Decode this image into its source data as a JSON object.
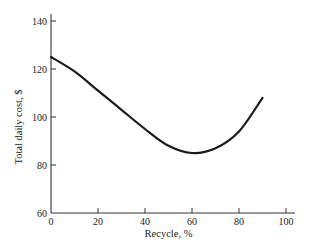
{
  "chart_data": {
    "type": "line",
    "title": "",
    "xlabel": "Recycle, %",
    "ylabel": "Total daily cost, $",
    "xlim": [
      0,
      100
    ],
    "ylim": [
      60,
      140
    ],
    "xticks": [
      0,
      20,
      40,
      60,
      80,
      100
    ],
    "yticks": [
      60,
      80,
      100,
      120,
      140
    ],
    "xtick_labels": [
      "0",
      "20",
      "40",
      "60",
      "80",
      "100"
    ],
    "ytick_labels": [
      "60",
      "80",
      "100",
      "120",
      "140"
    ],
    "grid": false,
    "legend": null,
    "series": [
      {
        "name": "Total daily cost",
        "x": [
          0,
          10,
          20,
          30,
          40,
          50,
          60,
          70,
          80,
          90
        ],
        "y": [
          125,
          119,
          111,
          103,
          95,
          88,
          85,
          87,
          94,
          108
        ]
      }
    ]
  }
}
